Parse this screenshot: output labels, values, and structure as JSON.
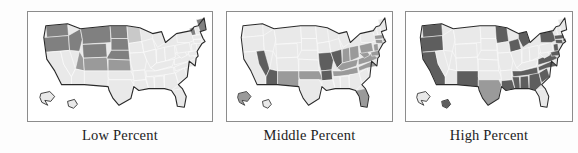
{
  "figure": {
    "type": "choropleth-map-series",
    "background_color": "#fdfdfd",
    "panel_border_color": "#8c8c8c",
    "outline_color": "#2a2a2a",
    "state_border_color": "#ffffff"
  },
  "shading": {
    "none": "#e9e9e9",
    "light": "#c9c9c9",
    "medium": "#9a9a9a",
    "dark": "#808080",
    "darkest": "#5e5e5e"
  },
  "panels": [
    {
      "id": "low-percent",
      "caption": "Low Percent",
      "highlighted_regions": "Northern Mountain and Plains states",
      "states": {
        "WA": "dark",
        "OR": "dark",
        "ID": "dark",
        "MT": "dark",
        "ND": "dark",
        "SD": "dark",
        "WY": "dark",
        "NE": "dark",
        "MN": "light",
        "IA": "none",
        "CA": "none",
        "NV": "none",
        "UT": "medium",
        "CO": "medium",
        "KS": "medium",
        "AZ": "none",
        "NM": "none",
        "OK": "none",
        "TX": "none",
        "MO": "none",
        "AR": "none",
        "LA": "none",
        "WI": "none",
        "IL": "none",
        "MI": "none",
        "IN": "none",
        "OH": "none",
        "KY": "none",
        "TN": "none",
        "MS": "none",
        "AL": "none",
        "GA": "none",
        "FL": "none",
        "SC": "none",
        "NC": "none",
        "VA": "none",
        "WV": "none",
        "PA": "none",
        "NY": "none",
        "ME": "dark",
        "VT": "dark",
        "NH": "none",
        "MA": "none",
        "CT": "none",
        "RI": "none",
        "NJ": "none",
        "DE": "none",
        "MD": "none",
        "AK": "none",
        "HI": "none"
      }
    },
    {
      "id": "middle-percent",
      "caption": "Middle Percent",
      "highlighted_regions": "Southwest, lower Midwest and Ohio Valley states",
      "states": {
        "WA": "none",
        "OR": "none",
        "ID": "none",
        "MT": "none",
        "ND": "none",
        "SD": "none",
        "WY": "none",
        "NE": "none",
        "MN": "none",
        "IA": "none",
        "CA": "none",
        "NV": "darkest",
        "UT": "none",
        "CO": "none",
        "KS": "none",
        "AZ": "darkest",
        "NM": "medium",
        "OK": "medium",
        "TX": "none",
        "MO": "darkest",
        "AR": "darkest",
        "LA": "none",
        "WI": "none",
        "IL": "darkest",
        "MI": "none",
        "IN": "medium",
        "OH": "medium",
        "KY": "medium",
        "TN": "medium",
        "MS": "none",
        "AL": "none",
        "GA": "none",
        "FL": "medium",
        "SC": "none",
        "NC": "medium",
        "VA": "medium",
        "WV": "medium",
        "PA": "medium",
        "NY": "none",
        "ME": "none",
        "VT": "none",
        "NH": "none",
        "MA": "medium",
        "CT": "medium",
        "RI": "medium",
        "NJ": "medium",
        "DE": "medium",
        "MD": "medium",
        "AK": "medium",
        "HI": "none"
      }
    },
    {
      "id": "high-percent",
      "caption": "High Percent",
      "highlighted_regions": "Pacific coast, Southwest and Southeast states",
      "states": {
        "WA": "darkest",
        "OR": "darkest",
        "ID": "none",
        "MT": "none",
        "ND": "none",
        "SD": "none",
        "WY": "none",
        "NE": "none",
        "MN": "darkest",
        "IA": "none",
        "CA": "darkest",
        "NV": "none",
        "UT": "none",
        "CO": "none",
        "KS": "none",
        "AZ": "none",
        "NM": "darkest",
        "OK": "none",
        "TX": "medium",
        "MO": "none",
        "AR": "none",
        "LA": "darkest",
        "WI": "darkest",
        "IL": "none",
        "MI": "darkest",
        "IN": "none",
        "OH": "none",
        "KY": "none",
        "TN": "darkest",
        "MS": "darkest",
        "AL": "darkest",
        "GA": "darkest",
        "FL": "none",
        "SC": "darkest",
        "NC": "darkest",
        "VA": "darkest",
        "WV": "none",
        "PA": "none",
        "NY": "darkest",
        "ME": "none",
        "VT": "none",
        "NH": "none",
        "MA": "darkest",
        "CT": "darkest",
        "RI": "darkest",
        "NJ": "darkest",
        "DE": "medium",
        "MD": "darkest",
        "AK": "none",
        "HI": "darkest"
      }
    }
  ]
}
